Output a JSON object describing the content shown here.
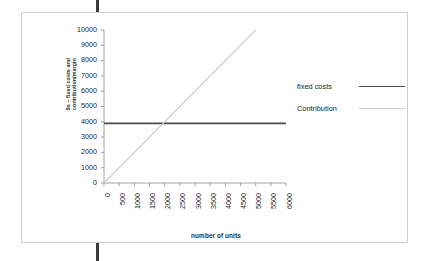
{
  "figure": {
    "y_axis_title": "$s – fixed costs and\ncontribution/margin",
    "x_axis_title": "number of units"
  },
  "legend": {
    "items": [
      {
        "label": "fixed costs",
        "color": "#4a4a4a",
        "name": "legend-item-fixed-costs"
      },
      {
        "label": "Contribution",
        "color": "#cccccc",
        "name": "legend-item-contribution"
      }
    ]
  },
  "chart_data": {
    "type": "line",
    "title": "",
    "subtitle": "",
    "xlabel": "number of units",
    "ylabel": "$s – fixed costs and contribution/margin",
    "xlim": [
      0,
      6000
    ],
    "ylim": [
      0,
      10000
    ],
    "xticks": [
      0,
      500,
      1000,
      1500,
      2000,
      2500,
      3000,
      3500,
      4000,
      4500,
      5000,
      5500,
      6000
    ],
    "xtick_labels": [
      "0",
      "500",
      "1000",
      "1500",
      "2000",
      "2500",
      "3000",
      "3500",
      "4000",
      "4500",
      "5000",
      "5500",
      "6000"
    ],
    "yticks": [
      0,
      1000,
      2000,
      3000,
      4000,
      5000,
      6000,
      7000,
      8000,
      9000,
      10000
    ],
    "ytick_labels": [
      "0",
      "1000",
      "2000",
      "3000",
      "4000",
      "5000",
      "6000",
      "7000",
      "8000",
      "9000",
      "10000"
    ],
    "grid": false,
    "legend_position": "right",
    "series": [
      {
        "name": "fixed costs",
        "color": "#4a4a4a",
        "linewidth": 1.8,
        "x": [
          0,
          6000
        ],
        "values": [
          3900,
          3900
        ]
      },
      {
        "name": "Contribution",
        "color": "#cccccc",
        "linewidth": 1.1,
        "x": [
          0,
          5000
        ],
        "values": [
          0,
          10000
        ]
      }
    ],
    "annotations": [
      {
        "text": "break-even",
        "x": 1950,
        "y": 3900,
        "visible": false
      }
    ]
  }
}
